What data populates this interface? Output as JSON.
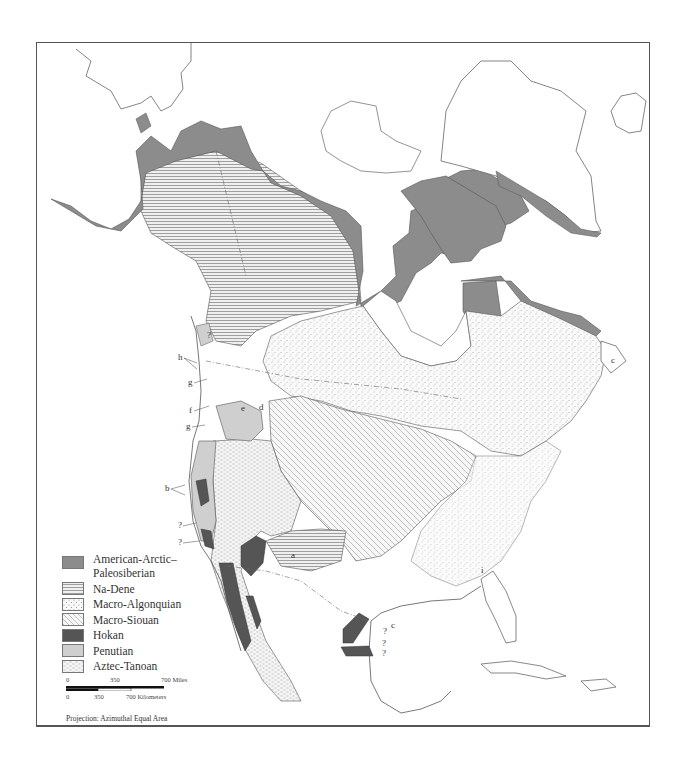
{
  "map": {
    "title": "",
    "projection_label": "Projection: Azimuthal Equal Area",
    "colors": {
      "american_arctic_paleosiberian": "#8c8c8c",
      "na_dene": "#e4e4e4",
      "macro_algonquian": "#f5f5f5",
      "macro_siouan": "#f0f0f0",
      "hokan": "#555555",
      "penutian": "#cfcfcf",
      "aztec_tanoan": "#f2f2f2"
    }
  },
  "legend": {
    "items": [
      {
        "label": "American-Arctic–Paleosiberian",
        "line1": "American-Arctic–",
        "line2": "Paleosiberian",
        "pattern": "solid-gray"
      },
      {
        "label": "Na-Dene",
        "pattern": "horizontal-lines"
      },
      {
        "label": "Macro-Algonquian",
        "pattern": "stipple-dots"
      },
      {
        "label": "Macro-Siouan",
        "pattern": "diagonal-lines"
      },
      {
        "label": "Hokan",
        "pattern": "solid-dark"
      },
      {
        "label": "Penutian",
        "pattern": "solid-light-gray"
      },
      {
        "label": "Aztec-Tanoan",
        "pattern": "dashes"
      }
    ]
  },
  "scale_bar": {
    "miles": {
      "ticks": [
        "0",
        "350",
        "700 Miles"
      ]
    },
    "kilometers": {
      "ticks": [
        "0",
        "350",
        "700 Kilometers"
      ]
    }
  },
  "annotations": [
    {
      "text": "h",
      "near": "British Columbia coast"
    },
    {
      "text": "g",
      "near": "Washington coast"
    },
    {
      "text": "f",
      "near": "Columbia River"
    },
    {
      "text": "g",
      "near": "Oregon coast"
    },
    {
      "text": "b",
      "near": "Northern California coast"
    },
    {
      "text": "?",
      "near": "Central California coast"
    },
    {
      "text": "?",
      "near": "Southern California coast"
    },
    {
      "text": "d",
      "near": "Northern Plains"
    },
    {
      "text": "e",
      "near": "Columbia Plateau"
    },
    {
      "text": "a",
      "near": "New Mexico"
    },
    {
      "text": "c",
      "near": "Texas Gulf coast"
    },
    {
      "text": "?",
      "near": "Texas coast"
    },
    {
      "text": "?",
      "near": "Tamaulipas coast"
    },
    {
      "text": "?",
      "near": "Tamaulipas coast south"
    },
    {
      "text": "i",
      "near": "Georgia"
    },
    {
      "text": "c",
      "near": "Newfoundland"
    },
    {
      "text": "?",
      "near": "Alaska panhandle"
    }
  ]
}
